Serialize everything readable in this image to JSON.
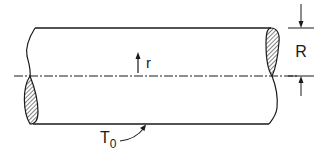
{
  "diagram": {
    "type": "cylinder-cross-section",
    "labels": {
      "radial_coordinate": "r",
      "radius": "R",
      "surface_temperature": "T",
      "surface_temperature_subscript": "0"
    },
    "colors": {
      "stroke": "#1a1a1a",
      "background": "#ffffff"
    }
  }
}
